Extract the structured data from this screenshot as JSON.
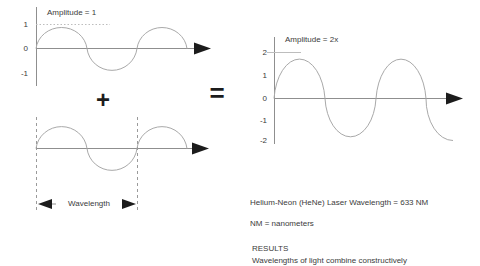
{
  "diagram": {
    "wave1": {
      "amplitude_label": "Amplitude = 1",
      "ticks": [
        "1",
        "0",
        "-1"
      ]
    },
    "operator_plus": "+",
    "operator_equals": "=",
    "wave2": {
      "wavelength_label": "Wavelength"
    },
    "wave3": {
      "amplitude_label": "Amplitude = 2x",
      "ticks": [
        "2",
        "1",
        "0",
        "-1",
        "-2"
      ]
    },
    "notes": {
      "laser_line": "Helium-Neon (HeNe) Laser Wavelength = 633 NM",
      "nm_line": "NM = nanometers",
      "results_heading": "RESULTS",
      "results_text": "Wavelengths of light combine constructively"
    },
    "colors": {
      "curve": "#a9a9a9",
      "axis": "#8f8f8f",
      "arrow": "#1c1c1c",
      "text": "#3b3b3b",
      "dash": "#9a9a9a",
      "refline": "#bdbdbd"
    }
  }
}
